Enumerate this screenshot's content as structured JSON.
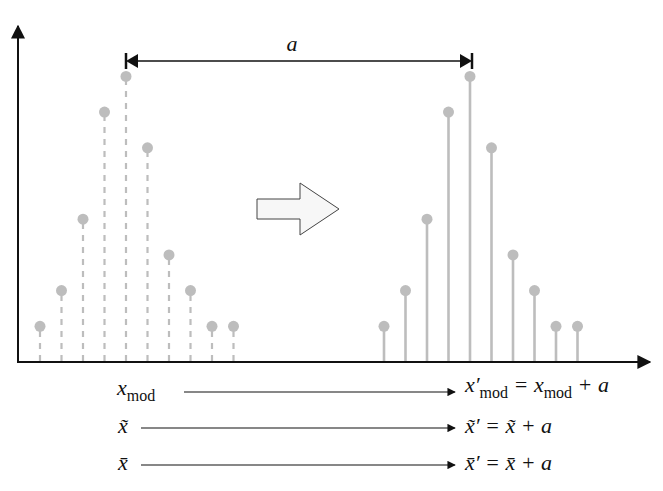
{
  "chart_data": {
    "type": "stem",
    "title": "",
    "ylim": [
      0,
      8.5
    ],
    "original": {
      "name": "original distribution",
      "style": "dashed",
      "x": [
        1,
        2,
        3,
        4,
        5,
        6,
        7,
        8,
        9,
        10
      ],
      "values": [
        1,
        2,
        4,
        7,
        8,
        6,
        3,
        2,
        1,
        1
      ]
    },
    "shifted": {
      "name": "shifted distribution",
      "style": "solid",
      "x": [
        17,
        18,
        19,
        20,
        21,
        22,
        23,
        24,
        25,
        26
      ],
      "values": [
        1,
        2,
        4,
        7,
        8,
        6,
        3,
        2,
        1,
        1
      ]
    },
    "xlim": [
      -0.5,
      28.5
    ],
    "shift_label": "a",
    "colors": {
      "stem": "#bdbdbd",
      "axis": "#111111"
    }
  },
  "equations": [
    {
      "lhs_base": "x",
      "lhs_sub": "mod",
      "rhs_base": "x′",
      "rhs_sub": "mod",
      "rhs_rest_base": " = x",
      "rhs_rest_sub": "mod",
      "rhs_tail": " + a"
    },
    {
      "lhs": "x̃",
      "rhs": "x̃′ = x̃ + a"
    },
    {
      "lhs": "x̄",
      "rhs": "x̄′ = x̄ + a"
    }
  ]
}
